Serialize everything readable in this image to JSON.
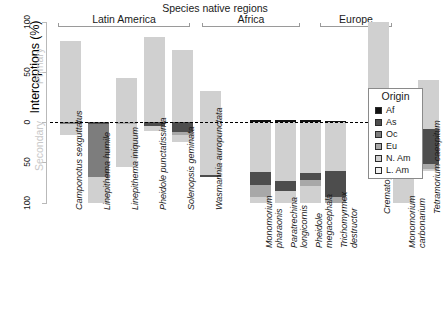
{
  "chart_data": {
    "type": "bar",
    "title": "Species native regions",
    "ylabel": "Interceptions (%)",
    "xlabel": "",
    "ylim": [
      -100,
      100
    ],
    "yticks": [
      100,
      50,
      0,
      50,
      100
    ],
    "ytick_labels": [
      "100",
      "50",
      "0",
      "50",
      "100"
    ],
    "axis_side_captions": {
      "upper": "Primary",
      "lower": "Secondary"
    },
    "grid": false,
    "legend": {
      "title": "Origin",
      "position": "right",
      "entries": [
        {
          "label": "Af",
          "color": "#111111"
        },
        {
          "label": "As",
          "color": "#4d4d4d"
        },
        {
          "label": "Oc",
          "color": "#7d7d7d"
        },
        {
          "label": "Eu",
          "color": "#a8a8a8"
        },
        {
          "label": "N. Am",
          "color": "#d0d0d0"
        },
        {
          "label": "L. Am",
          "color": "#f2f2f2"
        }
      ]
    },
    "groups": [
      {
        "name": "Latin America",
        "species_count": 6
      },
      {
        "name": "Africa",
        "species_count": 4
      },
      {
        "name": "Europe",
        "species_count": 3
      }
    ],
    "series": [
      {
        "name": "Af",
        "color": "#111111"
      },
      {
        "name": "As",
        "color": "#4d4d4d"
      },
      {
        "name": "Oc",
        "color": "#7d7d7d"
      },
      {
        "name": "Eu",
        "color": "#a8a8a8"
      },
      {
        "name": "N. Am",
        "color": "#d0d0d0"
      },
      {
        "name": "L. Am",
        "color": "#f2f2f2"
      }
    ],
    "categories": [
      "Camponotus sexguttatus",
      "Linepithema humile",
      "Linepithema iniquum",
      "Pheidole punctatissima",
      "Solenopsis geminata",
      "Wasmannia auropunctata",
      "Monomorium pharaonis",
      "Paratrechina longicornis",
      "Pheidole megacephala",
      "Trichomyrmex destructor",
      "Crematogaster scutellaris",
      "Monomorium carbonarium",
      "Tetramorium caespitum"
    ],
    "bars": [
      {
        "species": "Camponotus sexguttatus",
        "group": "Latin America",
        "primary": [
          {
            "origin": "N. Am",
            "value": 81
          }
        ],
        "secondary": [
          {
            "origin": "Oc",
            "value": 3
          },
          {
            "origin": "N. Am",
            "value": 13
          }
        ]
      },
      {
        "species": "Linepithema humile",
        "group": "Latin America",
        "primary": [],
        "secondary": [
          {
            "origin": "As",
            "value": 2
          },
          {
            "origin": "Oc",
            "value": 66
          },
          {
            "origin": "N. Am",
            "value": 32
          }
        ]
      },
      {
        "species": "Linepithema iniquum",
        "group": "Latin America",
        "primary": [
          {
            "origin": "N. Am",
            "value": 44
          }
        ],
        "secondary": [
          {
            "origin": "Eu",
            "value": 3
          },
          {
            "origin": "N. Am",
            "value": 53
          }
        ]
      },
      {
        "species": "Pheidole punctatissima",
        "group": "Latin America",
        "primary": [
          {
            "origin": "N. Am",
            "value": 85
          }
        ],
        "secondary": [
          {
            "origin": "As",
            "value": 5
          },
          {
            "origin": "N. Am",
            "value": 6
          }
        ]
      },
      {
        "species": "Solenopsis geminata",
        "group": "Latin America",
        "primary": [
          {
            "origin": "N. Am",
            "value": 72
          }
        ],
        "secondary": [
          {
            "origin": "As",
            "value": 12
          },
          {
            "origin": "Eu",
            "value": 4
          },
          {
            "origin": "N. Am",
            "value": 9
          }
        ]
      },
      {
        "species": "Wasmannia auropunctata",
        "group": "Latin America",
        "primary": [
          {
            "origin": "N. Am",
            "value": 31
          }
        ],
        "secondary": [
          {
            "origin": "N. Am",
            "value": 65
          },
          {
            "origin": "As",
            "value": 3
          }
        ]
      },
      {
        "species": "Monomorium pharaonis",
        "group": "Africa",
        "primary": [
          {
            "origin": "Af",
            "value": 2
          }
        ],
        "secondary": [
          {
            "origin": "N. Am",
            "value": 62
          },
          {
            "origin": "As",
            "value": 16
          },
          {
            "origin": "Eu",
            "value": 15
          },
          {
            "origin": "N. Am",
            "value": 7
          }
        ]
      },
      {
        "species": "Paratrechina longicornis",
        "group": "Africa",
        "primary": [
          {
            "origin": "Af",
            "value": 2
          }
        ],
        "secondary": [
          {
            "origin": "N. Am",
            "value": 73
          },
          {
            "origin": "As",
            "value": 12
          },
          {
            "origin": "N. Am",
            "value": 15
          }
        ]
      },
      {
        "species": "Pheidole megacephala",
        "group": "Africa",
        "primary": [
          {
            "origin": "Af",
            "value": 2
          }
        ],
        "secondary": [
          {
            "origin": "N. Am",
            "value": 63
          },
          {
            "origin": "As",
            "value": 9
          },
          {
            "origin": "Eu",
            "value": 7
          },
          {
            "origin": "N. Am",
            "value": 21
          }
        ]
      },
      {
        "species": "Trichomyrmex destructor",
        "group": "Africa",
        "primary": [
          {
            "origin": "Af",
            "value": 1
          }
        ],
        "secondary": [
          {
            "origin": "N. Am",
            "value": 60
          },
          {
            "origin": "As",
            "value": 33
          },
          {
            "origin": "Eu",
            "value": 7
          }
        ]
      },
      {
        "species": "Crematogaster scutellaris",
        "group": "Europe",
        "primary": [
          {
            "origin": "N. Am",
            "value": 100
          }
        ],
        "secondary": []
      },
      {
        "species": "Monomorium carbonarium",
        "group": "Europe",
        "primary": [],
        "secondary": [
          {
            "origin": "N. Am",
            "value": 100
          }
        ]
      },
      {
        "species": "Tetramorium caespitum",
        "group": "Europe",
        "primary": [
          {
            "origin": "N. Am",
            "value": 42
          }
        ],
        "secondary": [
          {
            "origin": "N. Am",
            "value": 9
          },
          {
            "origin": "As",
            "value": 43
          },
          {
            "origin": "Eu",
            "value": 6
          },
          {
            "origin": "N. Am",
            "value": 2
          }
        ]
      }
    ]
  }
}
